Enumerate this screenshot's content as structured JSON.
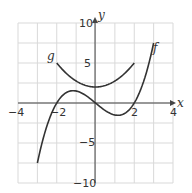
{
  "chart_data": {
    "type": "line",
    "title": "",
    "xlabel": "x",
    "ylabel": "y",
    "xlim": [
      -4,
      4
    ],
    "ylim": [
      -10,
      10
    ],
    "grid": true,
    "x_grid_step": 1,
    "y_grid_step": 2.5,
    "x_ticks": [
      "-4",
      "-2",
      "2",
      "4"
    ],
    "y_ticks": [
      "10",
      "5",
      "-5",
      "-10"
    ],
    "series": [
      {
        "name": "f",
        "label": "f",
        "expression": "0.5x^3 - 2x",
        "x": [
          -3,
          -2.5,
          -2,
          -1.5,
          -1.15,
          -1,
          -0.5,
          0,
          0.5,
          1,
          1.15,
          1.5,
          2,
          2.5,
          3
        ],
        "values": [
          -7.5,
          -2.81,
          0,
          1.31,
          1.54,
          1.5,
          0.94,
          0,
          -0.94,
          -1.5,
          -1.54,
          -1.31,
          0,
          2.81,
          7.5
        ]
      },
      {
        "name": "g",
        "label": "g",
        "expression": "0.75x^2 + 2",
        "x": [
          -2,
          -1.5,
          -1,
          -0.5,
          0,
          0.5,
          1,
          1.5,
          2
        ],
        "values": [
          5,
          3.69,
          2.75,
          2.19,
          2,
          2.19,
          2.75,
          3.69,
          5
        ]
      }
    ],
    "legend": "inline labels",
    "colors": {
      "curve": "#333333",
      "grid": "#d9d9d9",
      "axis": "#444444"
    }
  },
  "labels": {
    "x_axis": "x",
    "y_axis": "y",
    "f": "f",
    "g": "g",
    "tick_x_neg4": "−4",
    "tick_x_neg2": "−2",
    "tick_x_2": "2",
    "tick_x_4": "4",
    "tick_y_10": "10",
    "tick_y_5": "5",
    "tick_y_neg5": "−5",
    "tick_y_neg10": "−10"
  }
}
